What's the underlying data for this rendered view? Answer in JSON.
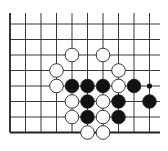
{
  "diagram": {
    "grid": {
      "x_lines": [
        10,
        25.5,
        41,
        56.5,
        72,
        87.5,
        103,
        118.5,
        134,
        149.5
      ],
      "y_lines": [
        24,
        39.5,
        55,
        70.5,
        86,
        101.5,
        117,
        132.5
      ],
      "left_edge": true,
      "bottom_edge": true,
      "line_color": "#222222"
    },
    "stone_radius": 6.8,
    "colors": {
      "black": "#111111",
      "white": "#ffffff",
      "outline": "#222222"
    },
    "stones": [
      {
        "color": "white",
        "col": 4,
        "row": 2
      },
      {
        "color": "white",
        "col": 6,
        "row": 2
      },
      {
        "color": "white",
        "col": 3,
        "row": 3
      },
      {
        "color": "white",
        "col": 7,
        "row": 3
      },
      {
        "color": "white",
        "col": 3,
        "row": 4
      },
      {
        "color": "black",
        "col": 4,
        "row": 4
      },
      {
        "color": "black",
        "col": 5,
        "row": 4
      },
      {
        "color": "black",
        "col": 6,
        "row": 4
      },
      {
        "color": "white",
        "col": 7,
        "row": 4
      },
      {
        "color": "black",
        "col": 8,
        "row": 4
      },
      {
        "color": "white",
        "col": 4,
        "row": 5
      },
      {
        "color": "black",
        "col": 5,
        "row": 5
      },
      {
        "color": "white",
        "col": 6,
        "row": 5
      },
      {
        "color": "black",
        "col": 7,
        "row": 5
      },
      {
        "color": "black",
        "col": 9,
        "row": 5
      },
      {
        "color": "white",
        "col": 4,
        "row": 6
      },
      {
        "color": "black",
        "col": 5,
        "row": 6
      },
      {
        "color": "white",
        "col": 6,
        "row": 6
      },
      {
        "color": "black",
        "col": 7,
        "row": 6
      },
      {
        "color": "white",
        "col": 5,
        "row": 7
      },
      {
        "color": "white",
        "col": 6,
        "row": 7
      }
    ],
    "markers": [
      {
        "type": "small-black-dot",
        "col": 10,
        "row": 4
      }
    ]
  }
}
